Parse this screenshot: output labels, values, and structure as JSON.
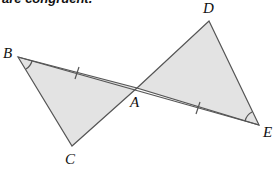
{
  "caption": "are congruent.",
  "diagram": {
    "fill_color": "#e3e3e3",
    "stroke_color": "#555555",
    "points": {
      "B": [
        18,
        57
      ],
      "C": [
        72,
        146
      ],
      "A": [
        137,
        88
      ],
      "D": [
        209,
        21
      ],
      "E": [
        259,
        125
      ]
    },
    "labels": {
      "B": "B",
      "C": "C",
      "A": "A",
      "D": "D",
      "E": "E"
    },
    "triangles": [
      {
        "name": "triangle-ABC",
        "vertices": [
          "A",
          "B",
          "C"
        ]
      },
      {
        "name": "triangle-ADE",
        "vertices": [
          "A",
          "D",
          "E"
        ]
      }
    ],
    "congruent_segments": [
      "BA",
      "AE"
    ],
    "congruent_angles": [
      "B",
      "E"
    ]
  }
}
